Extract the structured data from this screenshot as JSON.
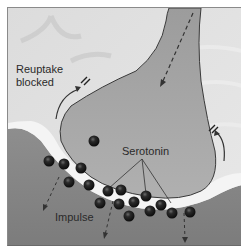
{
  "diagram": {
    "labels": {
      "reuptake": [
        "Reuptake",
        "blocked"
      ],
      "serotonin": "Serotonin",
      "impulse": "Impulse"
    },
    "colors": {
      "background": "#d9d9d9",
      "presynaptic_terminal": "#a8a8a8",
      "postsynaptic_membrane": "#9a9a9a",
      "synaptic_cleft": "#f2f2f2",
      "serotonin_molecule": "#1a1a1a",
      "outline": "#3a3a3a"
    },
    "serotonin_molecules": [
      {
        "x": 93,
        "y": 140
      },
      {
        "x": 48,
        "y": 160
      },
      {
        "x": 63,
        "y": 163
      },
      {
        "x": 80,
        "y": 167
      },
      {
        "x": 68,
        "y": 181
      },
      {
        "x": 88,
        "y": 184
      },
      {
        "x": 107,
        "y": 190
      },
      {
        "x": 120,
        "y": 189
      },
      {
        "x": 133,
        "y": 196
      },
      {
        "x": 145,
        "y": 195
      },
      {
        "x": 162,
        "y": 193
      },
      {
        "x": 149,
        "y": 208
      },
      {
        "x": 118,
        "y": 203
      },
      {
        "x": 172,
        "y": 203
      },
      {
        "x": 190,
        "y": 212
      },
      {
        "x": 171,
        "y": 213
      },
      {
        "x": 208,
        "y": 211
      }
    ]
  }
}
